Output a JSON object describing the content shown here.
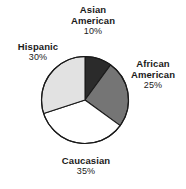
{
  "chart_data": {
    "type": "pie",
    "title": "",
    "categories": [
      "Asian American",
      "African American",
      "Caucasian",
      "Hispanic"
    ],
    "values": [
      10,
      25,
      35,
      30
    ],
    "unit": "%",
    "start_angle_deg": 0,
    "direction": "clockwise",
    "legend": "none",
    "labels_position": "outside",
    "slice_colors": [
      "#2b2b2b",
      "#757575",
      "#ffffff",
      "#e2e2e2"
    ],
    "stroke_color": "#1a1a1a",
    "slices": [
      {
        "name": "Asian American",
        "name_line1": "Asian",
        "name_line2": "American",
        "value": 10,
        "value_label": "10%",
        "color": "#2b2b2b",
        "start_deg": 0,
        "end_deg": 36
      },
      {
        "name": "African American",
        "name_line1": "African",
        "name_line2": "American",
        "value": 25,
        "value_label": "25%",
        "color": "#757575",
        "start_deg": 36,
        "end_deg": 126
      },
      {
        "name": "Caucasian",
        "name_line1": "Caucasian",
        "name_line2": "",
        "value": 35,
        "value_label": "35%",
        "color": "#ffffff",
        "start_deg": 126,
        "end_deg": 252
      },
      {
        "name": "Hispanic",
        "name_line1": "Hispanic",
        "name_line2": "",
        "value": 30,
        "value_label": "30%",
        "color": "#e2e2e2",
        "start_deg": 252,
        "end_deg": 360
      }
    ],
    "geometry": {
      "center_x": 85,
      "center_y": 100,
      "radius": 43.5
    }
  }
}
